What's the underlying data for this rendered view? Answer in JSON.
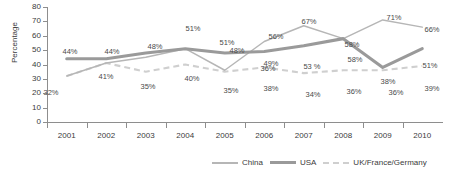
{
  "chart_data": {
    "type": "line",
    "title": "",
    "xlabel": "",
    "ylabel": "Percentage",
    "categories": [
      "2001",
      "2002",
      "2003",
      "2004",
      "2005",
      "2006",
      "2007",
      "2008",
      "2009",
      "2010"
    ],
    "ylim": [
      0,
      80
    ],
    "yticks": [
      0,
      10,
      20,
      30,
      40,
      50,
      60,
      70,
      80
    ],
    "grid": false,
    "legend_position": "bottom",
    "series": [
      {
        "name": "China",
        "style": "thin-solid",
        "color": "#b6b6b6",
        "values": [
          32,
          41,
          45,
          51,
          36,
          56,
          67,
          58,
          71,
          66
        ],
        "labels": [
          "",
          "",
          "",
          "51%",
          "36%",
          "56%",
          "67%",
          "58%",
          "71%",
          "66%"
        ]
      },
      {
        "name": "USA",
        "style": "thick-solid",
        "color": "#9a9a9a",
        "values": [
          44,
          44,
          48,
          51,
          48,
          49,
          53,
          58,
          38,
          51
        ],
        "labels": [
          "44%",
          "44%",
          "48%",
          "51%",
          "48%",
          "49%",
          "53 %",
          "58%",
          "38%",
          "51%"
        ]
      },
      {
        "name": "UK/France/Germany",
        "style": "dashed",
        "color": "#cfcfcf",
        "values": [
          32,
          41,
          35,
          40,
          35,
          38,
          34,
          36,
          36,
          39
        ],
        "labels": [
          "32%",
          "41%",
          "35%",
          "40%",
          "35%",
          "38%",
          "34%",
          "36%",
          "36%",
          "39%"
        ]
      }
    ]
  },
  "axis": {
    "y_title": "Percentage",
    "y_ticks": [
      "80",
      "70",
      "60",
      "50",
      "40",
      "30",
      "20",
      "10",
      "0"
    ],
    "x_ticks": [
      "2001",
      "2002",
      "2003",
      "2004",
      "2005",
      "2006",
      "2007",
      "2008",
      "2009",
      "2010"
    ]
  },
  "legend": {
    "items": [
      {
        "label": "China"
      },
      {
        "label": "USA"
      },
      {
        "label": "UK/France/Germany"
      }
    ]
  },
  "point_labels": {
    "usa": [
      {
        "text": "44%",
        "x": 70,
        "y": 47
      },
      {
        "text": "44%",
        "x": 112,
        "y": 47
      },
      {
        "text": "48%",
        "x": 155,
        "y": 42
      },
      {
        "text": "51%",
        "x": 193,
        "y": 24
      },
      {
        "text": "48%",
        "x": 237,
        "y": 46
      },
      {
        "text": "49%",
        "x": 271,
        "y": 59
      },
      {
        "text": "53 %",
        "x": 312,
        "y": 62
      },
      {
        "text": "58%",
        "x": 355,
        "y": 55
      },
      {
        "text": "38%",
        "x": 388,
        "y": 77
      },
      {
        "text": "51%",
        "x": 430,
        "y": 61
      }
    ],
    "china": [
      {
        "text": "51%",
        "x": 227,
        "y": 38
      },
      {
        "text": "36%",
        "x": 268,
        "y": 64
      },
      {
        "text": "56%",
        "x": 276,
        "y": 32
      },
      {
        "text": "67%",
        "x": 309,
        "y": 17
      },
      {
        "text": "58%",
        "x": 352,
        "y": 40
      },
      {
        "text": "71%",
        "x": 394,
        "y": 13
      },
      {
        "text": "66%",
        "x": 432,
        "y": 25
      }
    ],
    "uk": [
      {
        "text": "32%",
        "x": 51,
        "y": 88
      },
      {
        "text": "41%",
        "x": 106,
        "y": 72
      },
      {
        "text": "35%",
        "x": 148,
        "y": 82
      },
      {
        "text": "40%",
        "x": 192,
        "y": 74
      },
      {
        "text": "35%",
        "x": 231,
        "y": 86
      },
      {
        "text": "38%",
        "x": 271,
        "y": 84
      },
      {
        "text": "34%",
        "x": 313,
        "y": 90
      },
      {
        "text": "36%",
        "x": 354,
        "y": 87
      },
      {
        "text": "36%",
        "x": 396,
        "y": 88
      },
      {
        "text": "39%",
        "x": 432,
        "y": 84
      }
    ]
  }
}
